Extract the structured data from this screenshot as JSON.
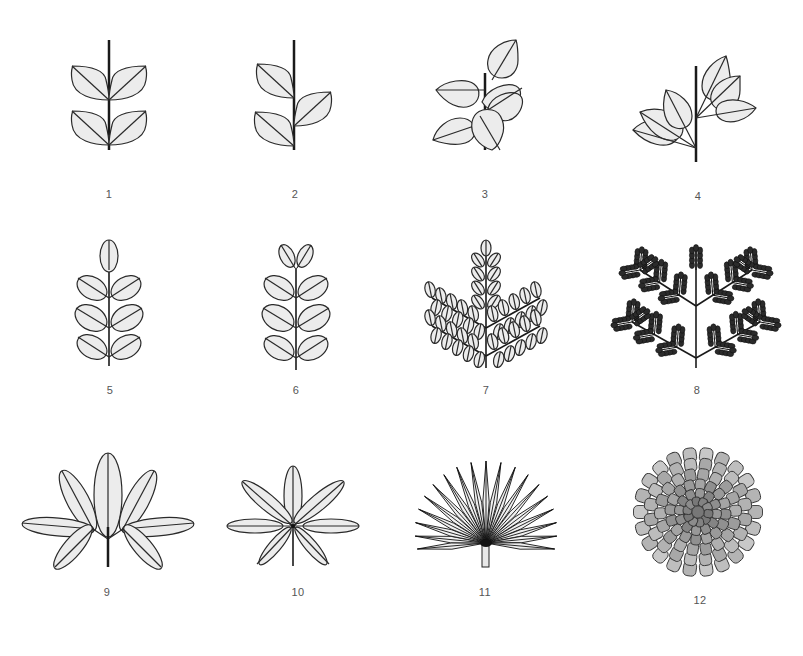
{
  "diagram": {
    "colors": {
      "leaf_fill": "#ececec",
      "stroke": "#2a2a2a",
      "label": "#555555",
      "background": "#ffffff"
    },
    "items": [
      {
        "id": 1,
        "label": "1"
      },
      {
        "id": 2,
        "label": "2"
      },
      {
        "id": 3,
        "label": "3"
      },
      {
        "id": 4,
        "label": "4"
      },
      {
        "id": 5,
        "label": "5"
      },
      {
        "id": 6,
        "label": "6"
      },
      {
        "id": 7,
        "label": "7"
      },
      {
        "id": 8,
        "label": "8"
      },
      {
        "id": 9,
        "label": "9"
      },
      {
        "id": 10,
        "label": "10"
      },
      {
        "id": 11,
        "label": "11"
      },
      {
        "id": 12,
        "label": "12"
      }
    ]
  }
}
